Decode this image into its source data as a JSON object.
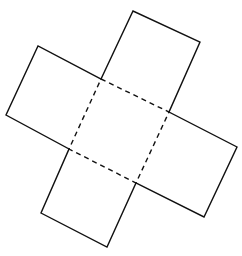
{
  "diagram": {
    "colors": {
      "background": "#ffffff",
      "line": "#111111"
    },
    "center_square": {
      "style": "dashed",
      "corners": [
        [
          101,
          79
        ],
        [
          169,
          112
        ],
        [
          136,
          183
        ],
        [
          69,
          149
        ]
      ]
    },
    "flaps": [
      {
        "name": "top",
        "outer": [
          [
            101,
            79
          ],
          [
            133,
            11
          ],
          [
            200,
            42
          ],
          [
            169,
            112
          ]
        ]
      },
      {
        "name": "right",
        "outer": [
          [
            169,
            112
          ],
          [
            237,
            147
          ],
          [
            204,
            217
          ],
          [
            136,
            183
          ]
        ]
      },
      {
        "name": "bottom",
        "outer": [
          [
            136,
            183
          ],
          [
            107,
            247
          ],
          [
            41,
            213
          ],
          [
            69,
            149
          ]
        ]
      },
      {
        "name": "left",
        "outer": [
          [
            69,
            149
          ],
          [
            6,
            115
          ],
          [
            38,
            46
          ],
          [
            101,
            79
          ]
        ]
      }
    ]
  }
}
